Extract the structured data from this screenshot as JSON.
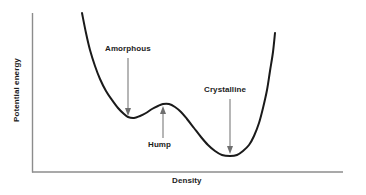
{
  "figure": {
    "background_color": "#ffffff",
    "width": 366,
    "height": 195
  },
  "axes": {
    "color": "#8c8c8c",
    "x_axis": {
      "label": "Density",
      "x_start": 32,
      "x_end": 343,
      "y": 172
    },
    "y_axis": {
      "label": "Potential energy",
      "x": 32,
      "y_start": 13,
      "y_end": 172
    }
  },
  "annotations": [
    {
      "id": "amorphous",
      "label": "Amorphous",
      "direction": "down",
      "target": "left-local-minimum"
    },
    {
      "id": "hump",
      "label": "Hump",
      "direction": "up",
      "target": "barrier-peak"
    },
    {
      "id": "crystalline",
      "label": "Crystalline",
      "direction": "down",
      "target": "global-minimum"
    }
  ],
  "chart_data": {
    "type": "line",
    "title": "",
    "xlabel": "Density",
    "ylabel": "Potential energy",
    "grid": false,
    "legend": null,
    "axis_ticks": {
      "x": [],
      "y": []
    },
    "xlim": [
      0,
      1
    ],
    "ylim": [
      0,
      1
    ],
    "series": [
      {
        "name": "potential-energy-landscape",
        "color": "#1a1a1a",
        "line_width": 2,
        "comment": "Double-well potential in pixel coordinates of the 366x195 figure",
        "points_px": [
          [
            82,
            13
          ],
          [
            86,
            33
          ],
          [
            90,
            50
          ],
          [
            95,
            66
          ],
          [
            100,
            79
          ],
          [
            106,
            91
          ],
          [
            112,
            100
          ],
          [
            118,
            108
          ],
          [
            124,
            114
          ],
          [
            128,
            117
          ],
          [
            134,
            118
          ],
          [
            140,
            116
          ],
          [
            146,
            113
          ],
          [
            152,
            109
          ],
          [
            158,
            106
          ],
          [
            163,
            104
          ],
          [
            169,
            104
          ],
          [
            175,
            107
          ],
          [
            181,
            112
          ],
          [
            187,
            119
          ],
          [
            194,
            128
          ],
          [
            201,
            137
          ],
          [
            208,
            145
          ],
          [
            215,
            151
          ],
          [
            222,
            155
          ],
          [
            230,
            156
          ],
          [
            237,
            155
          ],
          [
            243,
            151
          ],
          [
            249,
            145
          ],
          [
            254,
            136
          ],
          [
            259,
            123
          ],
          [
            263,
            108
          ],
          [
            267,
            90
          ],
          [
            270,
            71
          ],
          [
            273,
            52
          ],
          [
            275,
            33
          ]
        ],
        "features": {
          "left_local_minimum_px": [
            128,
            117
          ],
          "barrier_peak_px": [
            163,
            104
          ],
          "global_minimum_px": [
            230,
            156
          ],
          "left_branch_top_px": [
            82,
            13
          ],
          "right_branch_top_px": [
            275,
            33
          ]
        }
      }
    ],
    "annotation_arrows": [
      {
        "label": "Amorphous",
        "x_px": 128,
        "y_tail_px": 58,
        "y_head_px": 115,
        "direction": "down"
      },
      {
        "label": "Hump",
        "x_px": 163,
        "y_tail_px": 138,
        "y_head_px": 107,
        "direction": "up"
      },
      {
        "label": "Crystalline",
        "x_px": 230,
        "y_tail_px": 99,
        "y_head_px": 153,
        "direction": "down"
      }
    ]
  }
}
